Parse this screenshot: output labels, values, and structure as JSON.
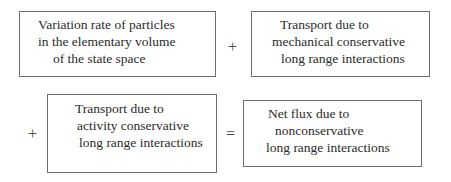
{
  "diagram": {
    "type": "equation-of-boxes",
    "terms": [
      {
        "id": "variation-rate",
        "lines": [
          "Variation rate of particles",
          "in the elementary volume",
          "of the state space"
        ]
      },
      {
        "id": "mechanical-transport",
        "lines": [
          "Transport due to",
          "mechanical conservative",
          "long range interactions"
        ]
      },
      {
        "id": "activity-transport",
        "lines": [
          "Transport due to",
          "activity conservative",
          "long range interactions"
        ]
      },
      {
        "id": "net-flux",
        "lines": [
          "Net flux due to",
          "nonconservative",
          "long range interactions"
        ]
      }
    ],
    "operators": {
      "plus_top": "+",
      "plus_bottom": "+",
      "equals": "="
    }
  }
}
